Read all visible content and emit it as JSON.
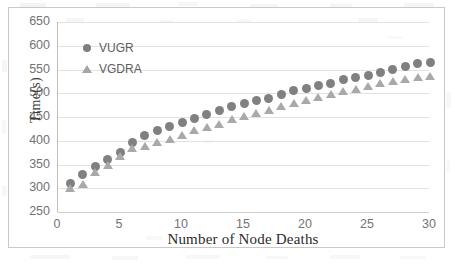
{
  "chart_data": {
    "type": "scatter",
    "title": "",
    "xlabel": "Number of Node Deaths",
    "ylabel": "Time(s)",
    "xlim": [
      0,
      30
    ],
    "ylim": [
      250,
      650
    ],
    "xticks": [
      0,
      5,
      10,
      15,
      20,
      25,
      30
    ],
    "yticks": [
      250,
      300,
      350,
      400,
      450,
      500,
      550,
      600,
      650
    ],
    "grid": "horizontal",
    "legend_position": "inside-top-left",
    "x": [
      1,
      2,
      3,
      4,
      5,
      6,
      7,
      8,
      9,
      10,
      11,
      12,
      13,
      14,
      15,
      16,
      17,
      18,
      19,
      20,
      21,
      22,
      23,
      24,
      25,
      26,
      27,
      28,
      29,
      30
    ],
    "series": [
      {
        "name": "VUGR",
        "marker": "circle",
        "color": "#808080",
        "values": [
          310,
          330,
          345,
          360,
          375,
          396,
          411,
          421,
          431,
          438,
          447,
          456,
          464,
          472,
          478,
          484,
          489,
          498,
          505,
          510,
          517,
          521,
          529,
          533,
          538,
          543,
          550,
          556,
          562,
          565
        ]
      },
      {
        "name": "VGDRA",
        "marker": "triangle",
        "color": "#a9a9a9",
        "values": [
          300,
          309,
          334,
          350,
          368,
          384,
          390,
          397,
          404,
          412,
          422,
          428,
          436,
          445,
          452,
          459,
          465,
          473,
          479,
          486,
          492,
          499,
          504,
          509,
          515,
          521,
          526,
          530,
          534,
          537
        ]
      }
    ]
  },
  "axes": {
    "y_title": "Time(s)",
    "x_title": "Number of Node Deaths",
    "y_tick_labels": [
      "650",
      "600",
      "550",
      "500",
      "450",
      "400",
      "350",
      "300",
      "250"
    ],
    "x_tick_labels": [
      "0",
      "5",
      "10",
      "15",
      "20",
      "25",
      "30"
    ]
  },
  "legend": {
    "entries": [
      {
        "label": "VUGR",
        "marker_name": "circle-marker-icon"
      },
      {
        "label": "VGDRA",
        "marker_name": "triangle-marker-icon"
      }
    ]
  },
  "colors": {
    "series_vugr": "#808080",
    "series_vgdra": "#a9a9a9",
    "gridline": "#e2e2e2",
    "frame": "#c9c9c9",
    "tick_text": "#737373"
  }
}
